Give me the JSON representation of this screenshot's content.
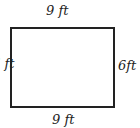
{
  "figure": {
    "shape": "rectangle",
    "labels": {
      "top": "9 ft",
      "bottom": "9 ft",
      "right": "6ft",
      "left": "6 ft"
    },
    "colors": {
      "stroke": "#222222",
      "fill": "#ffffff"
    }
  }
}
